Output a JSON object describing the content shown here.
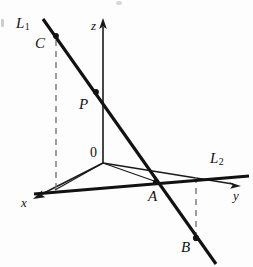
{
  "figure": {
    "kind": "3d-coordinate-geometry-diagram",
    "width": 253,
    "height": 267,
    "background_color": "#fdfdfd",
    "stroke_color": "#111111",
    "dashed_color": "#6e6e6e"
  },
  "axes": [
    {
      "id": "x",
      "label": "x",
      "label_x": 21,
      "label_y": 196,
      "direction": "down-left",
      "arrow": true
    },
    {
      "id": "y",
      "label": "y",
      "label_x": 233,
      "label_y": 189,
      "direction": "right",
      "arrow": true
    },
    {
      "id": "z",
      "label": "z",
      "label_x": 91,
      "label_y": 19,
      "direction": "up",
      "arrow": true
    }
  ],
  "lines": [
    {
      "id": "L1",
      "label": "L",
      "subscript": "1",
      "label_x": 16,
      "label_y": 16,
      "weight": "thick"
    },
    {
      "id": "L2",
      "label": "L",
      "subscript": "2",
      "label_x": 210,
      "label_y": 151,
      "weight": "thick"
    }
  ],
  "points": [
    {
      "id": "C",
      "label": "C",
      "label_x": 35,
      "label_y": 36,
      "dot_x": 56,
      "dot_y": 36,
      "on_line": "L1"
    },
    {
      "id": "P",
      "label": "P",
      "label_x": 79,
      "label_y": 97,
      "dot_x": 96,
      "dot_y": 92,
      "on_line": "L1"
    },
    {
      "id": "A",
      "label": "A",
      "label_x": 148,
      "label_y": 189,
      "dot_x": 156,
      "dot_y": 182,
      "on_line": "L1"
    },
    {
      "id": "B",
      "label": "B",
      "label_x": 181,
      "label_y": 240,
      "dot_x": 196,
      "dot_y": 238,
      "on_line": "L1"
    },
    {
      "id": "O",
      "label": "0",
      "label_x": 90,
      "label_y": 146,
      "dot_x": 103,
      "dot_y": 163,
      "on_line": "origin"
    }
  ],
  "dashed_segments": [
    {
      "id": "C-projection",
      "from": "C",
      "to": "x-axis-plane"
    },
    {
      "id": "B-projection",
      "from": "B",
      "to": "y-axis-plane"
    }
  ],
  "thin_segments": [
    {
      "id": "origin-to-x-foot"
    },
    {
      "id": "origin-to-A"
    }
  ]
}
